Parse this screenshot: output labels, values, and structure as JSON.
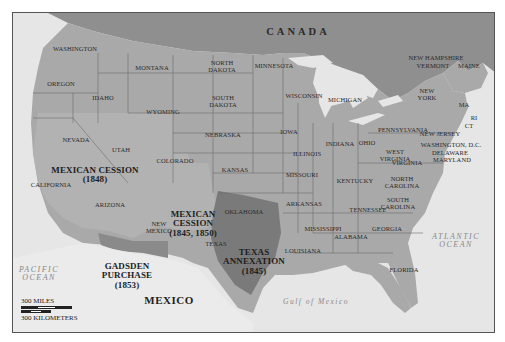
{
  "map": {
    "countries": {
      "canada": "CANADA",
      "mexico": "MEXICO"
    },
    "water": {
      "pacific": [
        "PACIFIC",
        "OCEAN"
      ],
      "atlantic": [
        "ATLANTIC",
        "OCEAN"
      ],
      "gulf": "Gulf of Mexico"
    },
    "territories": {
      "mexican_cession_1848": {
        "name": "MEXICAN CESSION",
        "year": "(1848)"
      },
      "mexican_cession_1845_1850": {
        "name": [
          "MEXICAN",
          "CESSION"
        ],
        "year": "(1845, 1850)"
      },
      "texas_annexation": {
        "name": [
          "TEXAS",
          "ANNEXATION"
        ],
        "year": "(1845)"
      },
      "gadsden_purchase": {
        "name": [
          "GADSDEN",
          "PURCHASE"
        ],
        "year": "(1853)"
      }
    },
    "states": {
      "washington": "WASHINGTON",
      "oregon": "OREGON",
      "idaho": "IDAHO",
      "montana": "MONTANA",
      "wyoming": "WYOMING",
      "north_dakota": [
        "NORTH",
        "DAKOTA"
      ],
      "south_dakota": [
        "SOUTH",
        "DAKOTA"
      ],
      "minnesota": "MINNESOTA",
      "wisconsin": "WISCONSIN",
      "michigan": "MICHIGAN",
      "nevada": "NEVADA",
      "utah": "UTAH",
      "california": "CALIFORNIA",
      "colorado": "COLORADO",
      "nebraska": "NEBRASKA",
      "iowa": "IOWA",
      "illinois": "ILLINOIS",
      "indiana": "INDIANA",
      "ohio": "OHIO",
      "kansas": "KANSAS",
      "missouri": "MISSOURI",
      "kentucky": "KENTUCKY",
      "arizona": "ARIZONA",
      "new_mexico": [
        "NEW",
        "MEXICO"
      ],
      "oklahoma": "OKLAHOMA",
      "arkansas": "ARKANSAS",
      "tennessee": "TENNESSEE",
      "texas": "TEXAS",
      "louisiana": "LOUISIANA",
      "mississippi": "MISSISSIPPI",
      "alabama": "ALABAMA",
      "georgia": "GEORGIA",
      "florida": "FLORIDA",
      "north_carolina": [
        "NORTH",
        "CAROLINA"
      ],
      "south_carolina": [
        "SOUTH",
        "CAROLINA"
      ],
      "virginia": "VIRGINIA",
      "west_virginia": [
        "WEST",
        "VIRGINIA"
      ],
      "pennsylvania": "PENNSYLVANIA",
      "new_york": [
        "NEW",
        "YORK"
      ],
      "new_jersey": "NEW JERSEY",
      "washington_dc": "WASHINGTON, D.C.",
      "delaware": "DELAWARE",
      "maryland": "MARYLAND",
      "new_hampshire": "NEW HAMPSHIRE",
      "vermont": "VERMONT",
      "maine": "MAINE",
      "massachusetts": "MA",
      "rhode_island": "RI",
      "connecticut": "CT"
    },
    "scale": {
      "miles": "300 MILES",
      "kilometers": "300 KILOMETERS"
    },
    "colors": {
      "water": "#e6e6e6",
      "canada": "#8f8f8f",
      "us_states": "#a9a9a9",
      "mexican_cession": "#b2b2b2",
      "texas_annexation": "#7a7a7a",
      "gadsden": "#8a8a8a",
      "mexico": "#e9e9e9",
      "border": "#5a5a5a"
    }
  }
}
